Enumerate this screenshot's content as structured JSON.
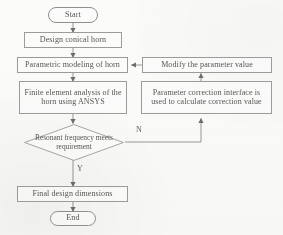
{
  "diagram": {
    "type": "flowchart",
    "background_color": "#fbfbfa",
    "stroke_color": "#9b9b98",
    "text_color": "#555553"
  },
  "nodes": {
    "start": {
      "label": "Start",
      "shape": "terminator"
    },
    "design": {
      "label": "Design conical horn",
      "shape": "process"
    },
    "parametric": {
      "label": "Parametric modeling of horn",
      "shape": "process"
    },
    "fea": {
      "label": "Finite element analysis of the horn using ANSYS",
      "shape": "process"
    },
    "modify": {
      "label": "Modify the parameter value",
      "shape": "process"
    },
    "correction": {
      "label": "Parameter correction interface is used to calculate correction value",
      "shape": "process"
    },
    "decision": {
      "label": "Resonant frequency meets requirement",
      "shape": "decision"
    },
    "final": {
      "label": "Final design dimensions",
      "shape": "process"
    },
    "end": {
      "label": "End",
      "shape": "terminator"
    }
  },
  "edge_labels": {
    "no": "N",
    "yes": "Y"
  }
}
